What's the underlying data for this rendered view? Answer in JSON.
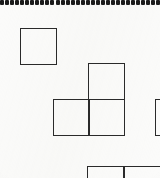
{
  "figure": {
    "type": "diagram",
    "background_color": "#fbfbfa",
    "stroke_color": "#2a2a2a",
    "stroke_width_px": 1.6,
    "canvas": {
      "width": 160,
      "height": 178
    },
    "unit_square_px": 37
  },
  "dotted_rule": {
    "name": "dotted-rule",
    "dot_count": 32,
    "dot_width_px": 4,
    "dot_height_px": 5,
    "dot_gap_px": 1,
    "color": "#1b1b1b",
    "y_px": 0
  },
  "shapes": [
    {
      "name": "single-square",
      "label": "",
      "x": 20,
      "y": 28,
      "width": 37,
      "height": 37,
      "complete": true
    },
    {
      "name": "l-tromino-top-square",
      "label": "",
      "x": 88,
      "y": 63,
      "width": 37,
      "height": 37,
      "complete": true
    },
    {
      "name": "l-tromino-left-square",
      "label": "",
      "x": 53,
      "y": 99,
      "width": 37,
      "height": 37,
      "complete": true
    },
    {
      "name": "l-tromino-right-square",
      "label": "",
      "x": 88,
      "y": 99,
      "width": 37,
      "height": 37,
      "complete": true
    },
    {
      "name": "clipped-square-right",
      "label": "",
      "x": 155,
      "y": 99,
      "width": 37,
      "height": 37,
      "complete": false
    },
    {
      "name": "clipped-square-bottom-left",
      "label": "",
      "x": 87,
      "y": 166,
      "width": 37,
      "height": 37,
      "complete": false
    },
    {
      "name": "clipped-square-bottom-right",
      "label": "",
      "x": 124,
      "y": 166,
      "width": 37,
      "height": 37,
      "complete": false
    }
  ]
}
